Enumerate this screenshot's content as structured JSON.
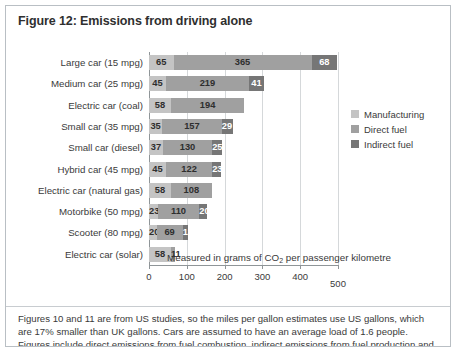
{
  "figure": {
    "title": "Figure 12: Emissions from driving alone",
    "footnote": "Figures 10 and 11 are from US studies, so the miles per gallon estimates use US gallons, which are 17% smaller than UK gallons. Cars are assumed to have an average load of 1.6 people. Figures include direct emissions from fuel combustion, indirect emissions from fuel production and vehicle manufacture, and the emissions from electricity generation."
  },
  "legend": {
    "items": [
      {
        "label": "Manufacturing",
        "color": "#c4c4c4"
      },
      {
        "label": "Direct fuel",
        "color": "#a0a0a0"
      },
      {
        "label": "Indirect fuel",
        "color": "#767676"
      }
    ]
  },
  "axis": {
    "caption_prefix": "Measured in grams of CO",
    "caption_sub": "2",
    "caption_suffix": " per passenger kilometre",
    "ticks": [
      "0",
      "100",
      "200",
      "300",
      "400",
      "500"
    ]
  },
  "chart_data": {
    "type": "bar",
    "orientation": "horizontal",
    "stacked": true,
    "title": "Figure 12: Emissions from driving alone",
    "xlabel": "Measured in grams of CO2 per passenger kilometre",
    "ylabel": "",
    "xlim": [
      0,
      500
    ],
    "xticks": [
      0,
      100,
      200,
      300,
      400,
      500
    ],
    "grid": true,
    "legend_position": "right",
    "categories": [
      "Large car (15 mpg)",
      "Medium car (25 mpg)",
      "Electric car (coal)",
      "Small car (35 mpg)",
      "Small car (diesel)",
      "Hybrid car (45 mpg)",
      "Electric car (natural gas)",
      "Motorbike (50 mpg)",
      "Scooter (80 mpg)",
      "Electric car (solar)"
    ],
    "series": [
      {
        "name": "Manufacturing",
        "color": "#c4c4c4",
        "values": [
          65,
          45,
          58,
          35,
          37,
          45,
          58,
          23,
          20,
          58
        ]
      },
      {
        "name": "Direct fuel",
        "color": "#a0a0a0",
        "values": [
          365,
          219,
          194,
          157,
          130,
          122,
          108,
          110,
          69,
          11
        ]
      },
      {
        "name": "Indirect fuel",
        "color": "#767676",
        "values": [
          68,
          41,
          null,
          29,
          25,
          23,
          null,
          20,
          13,
          null
        ]
      }
    ],
    "totals": [
      498,
      305,
      252,
      221,
      192,
      190,
      166,
      153,
      102,
      69
    ]
  }
}
